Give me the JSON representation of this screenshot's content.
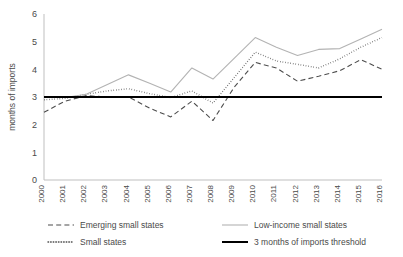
{
  "chart_data": {
    "type": "line",
    "title": "",
    "xlabel": "",
    "ylabel": "months of imports",
    "ylim": [
      0,
      6
    ],
    "yticks": [
      0,
      1,
      2,
      3,
      4,
      5,
      6
    ],
    "grid": false,
    "legend_position": "bottom",
    "categories": [
      "2000",
      "2001",
      "2002",
      "2003",
      "2004",
      "2005",
      "2006",
      "2007",
      "2008",
      "2009",
      "2010",
      "2011",
      "2012",
      "2013",
      "2014",
      "2015",
      "2016"
    ],
    "x": [
      2000,
      2001,
      2002,
      2003,
      2004,
      2005,
      2006,
      2007,
      2008,
      2009,
      2010,
      2011,
      2012,
      2013,
      2014,
      2015,
      2016
    ],
    "series": [
      {
        "name": "Emerging small states",
        "style": "dashed",
        "color": "#4d4d4d",
        "values": [
          2.45,
          2.85,
          3.05,
          3.0,
          3.0,
          2.6,
          2.28,
          2.85,
          2.15,
          3.35,
          4.25,
          4.05,
          3.57,
          3.75,
          3.95,
          4.35,
          4.0
        ]
      },
      {
        "name": "Small states",
        "style": "dotted",
        "color": "#4d4d4d",
        "values": [
          2.9,
          2.95,
          3.1,
          3.22,
          3.3,
          3.12,
          2.98,
          3.22,
          2.78,
          3.7,
          4.62,
          4.3,
          4.18,
          4.05,
          4.38,
          4.8,
          5.15
        ]
      },
      {
        "name": "Low-income small states",
        "style": "solid-light",
        "color": "#b3b3b3",
        "values": [
          3.0,
          2.98,
          3.1,
          3.45,
          3.8,
          3.5,
          3.18,
          4.05,
          3.65,
          4.4,
          5.15,
          4.8,
          4.5,
          4.72,
          4.75,
          5.1,
          5.45
        ]
      },
      {
        "name": "3 months of imports threshold",
        "style": "solid-bold",
        "color": "#000000",
        "values": [
          3.0,
          3.0,
          3.0,
          3.0,
          3.0,
          3.0,
          3.0,
          3.0,
          3.0,
          3.0,
          3.0,
          3.0,
          3.0,
          3.0,
          3.0,
          3.0,
          3.0
        ]
      }
    ]
  },
  "axes": {
    "ylabel": "months of imports",
    "ytick_labels": [
      "0",
      "1",
      "2",
      "3",
      "4",
      "5",
      "6"
    ],
    "xtick_labels": [
      "2000",
      "2001",
      "2002",
      "2003",
      "2004",
      "2005",
      "2006",
      "2007",
      "2008",
      "2009",
      "2010",
      "2011",
      "2012",
      "2013",
      "2014",
      "2015",
      "2016"
    ]
  },
  "legend": {
    "entries": [
      {
        "label": "Emerging small states",
        "style": "dashed",
        "color": "#4d4d4d"
      },
      {
        "label": "Low-income small states",
        "style": "solid-light",
        "color": "#b3b3b3"
      },
      {
        "label": "Small states",
        "style": "dotted",
        "color": "#4d4d4d"
      },
      {
        "label": "3 months of imports threshold",
        "style": "solid-bold",
        "color": "#000000"
      }
    ]
  }
}
